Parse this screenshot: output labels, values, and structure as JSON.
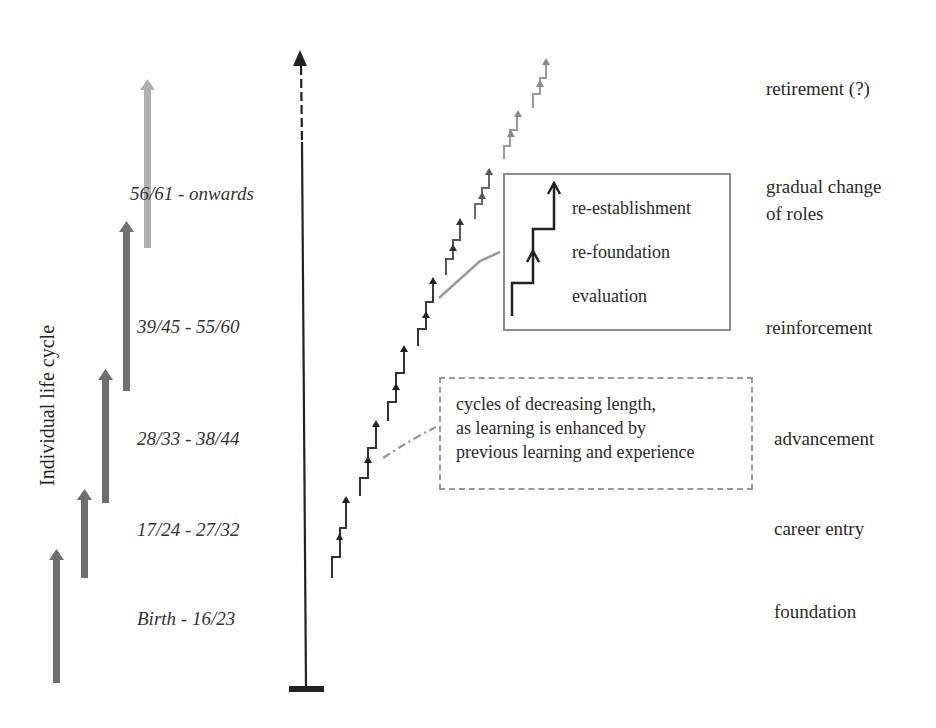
{
  "diagram": {
    "vertical_label": "Individual life cycle",
    "age_ranges": [
      {
        "label": "56/61 - onwards",
        "x": 132,
        "y": 183
      },
      {
        "label": "39/45 - 55/60",
        "x": 138,
        "y": 316
      },
      {
        "label": "28/33 - 38/44",
        "x": 138,
        "y": 428
      },
      {
        "label": "17/24 - 27/32",
        "x": 138,
        "y": 519
      },
      {
        "label": "Birth - 16/23",
        "x": 138,
        "y": 607
      }
    ],
    "phases": [
      {
        "label": "retirement (?)",
        "x": 766,
        "y": 78
      },
      {
        "label": "gradual change",
        "x": 766,
        "y": 176
      },
      {
        "label": "of roles",
        "x": 766,
        "y": 203
      },
      {
        "label": "reinforcement",
        "x": 766,
        "y": 316
      },
      {
        "label": "advancement",
        "x": 774,
        "y": 427
      },
      {
        "label": "career entry",
        "x": 774,
        "y": 518
      },
      {
        "label": "foundation",
        "x": 774,
        "y": 601
      }
    ],
    "life_cycle_arrows": [
      {
        "x": 56,
        "y_top": 550,
        "y_bottom": 683,
        "color": "#6e6e6e"
      },
      {
        "x": 84,
        "y_top": 490,
        "y_bottom": 578,
        "color": "#6e6e6e"
      },
      {
        "x": 105,
        "y_top": 370,
        "y_bottom": 503,
        "color": "#6e6e6e"
      },
      {
        "x": 126,
        "y_top": 222,
        "y_bottom": 391,
        "color": "#707070"
      },
      {
        "x": 147,
        "y_top": 80,
        "y_bottom": 248,
        "color": "#b0b0b0"
      }
    ],
    "legend_box": {
      "items": [
        "re-establishment",
        "re-foundation",
        "evaluation"
      ]
    },
    "note_box": {
      "lines": [
        "cycles of decreasing length,",
        "as learning is enhanced by",
        "previous learning and experience"
      ]
    },
    "colors": {
      "axis": "#222222",
      "stairs_dark": "#2a2a2a",
      "stairs_light": "#8a8a8a",
      "connector": "#9a9a9a",
      "box_border": "#8c8c8c"
    }
  }
}
